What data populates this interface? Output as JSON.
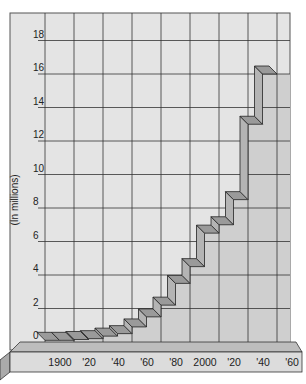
{
  "chart_data": {
    "type": "bar",
    "style": "3d-staircase",
    "title": "",
    "xlabel": "",
    "ylabel": "(In millions)",
    "ylim": [
      0,
      18
    ],
    "yticks": [
      0,
      2,
      4,
      6,
      8,
      10,
      12,
      14,
      16,
      18
    ],
    "ytick_labels": [
      "0",
      "2",
      "4",
      "6",
      "8",
      "10",
      "12",
      "14",
      "16",
      "18"
    ],
    "xtick_labels": [
      "1900",
      "'20",
      "'40",
      "'60",
      "'80",
      "2000",
      "'20",
      "'40",
      "'60"
    ],
    "grid": true,
    "categories": [
      "1900",
      "1910",
      "1920",
      "1930",
      "1940",
      "1950",
      "1960",
      "1970",
      "1980",
      "1990",
      "2000",
      "2010",
      "2020",
      "2030",
      "2040",
      "2050"
    ],
    "values": [
      0.1,
      0.1,
      0.15,
      0.2,
      0.35,
      0.5,
      0.9,
      1.5,
      2.2,
      3.5,
      4.5,
      6.5,
      7.0,
      8.5,
      13.0,
      16.0
    ],
    "colors": {
      "background": "#e4e4e4",
      "under_area": "#cfcfcf",
      "step_top": "#9a9a9a",
      "step_front": "#b4b4b4",
      "base": "#dcdcdc",
      "grid": "#333333"
    }
  }
}
